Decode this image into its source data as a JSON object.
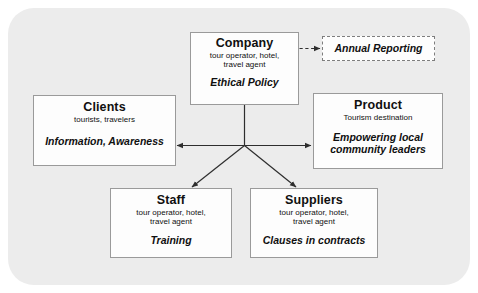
{
  "diagram": {
    "background_color": "#ececec",
    "page_color": "#ffffff",
    "box_fill": "#fdfdfd",
    "box_border_color": "#9a9a9a",
    "connector_color": "#3a3a3a",
    "nodes": {
      "company": {
        "title": "Company",
        "subtitle_line1": "tour operator, hotel,",
        "subtitle_line2": "travel agent",
        "action": "Ethical Policy"
      },
      "annual_reporting": {
        "action": "Annual Reporting",
        "border_style": "dashed"
      },
      "clients": {
        "title": "Clients",
        "subtitle_line1": "tourists, travelers",
        "action": "Information, Awareness"
      },
      "product": {
        "title": "Product",
        "subtitle_line1": "Tourism destination",
        "action_line1": "Empowering local",
        "action_line2": "community leaders"
      },
      "staff": {
        "title": "Staff",
        "subtitle_line1": "tour operator, hotel,",
        "subtitle_line2": "travel agent",
        "action": "Training"
      },
      "suppliers": {
        "title": "Suppliers",
        "subtitle_line1": "tour operator, hotel,",
        "subtitle_line2": "travel agent",
        "action": "Clauses in contracts"
      }
    },
    "connectors": [
      {
        "name": "company-to-annual-reporting",
        "style": "dashed",
        "arrows": "end"
      },
      {
        "name": "company-to-hub",
        "style": "solid",
        "arrows": "none"
      },
      {
        "name": "clients-to-product",
        "style": "solid",
        "arrows": "both"
      },
      {
        "name": "hub-to-staff",
        "style": "solid",
        "arrows": "end"
      },
      {
        "name": "hub-to-suppliers",
        "style": "solid",
        "arrows": "end"
      }
    ]
  }
}
